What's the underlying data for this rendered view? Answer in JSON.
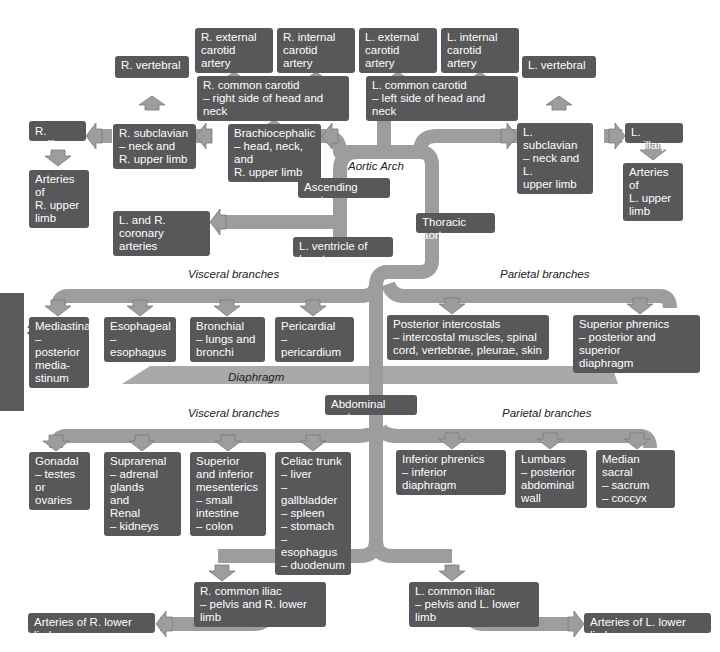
{
  "page_tab": "32",
  "colors": {
    "box": "#58585a",
    "arrow_fill": "#9d9d9f",
    "arrow_stroke": "#7a7a7c",
    "diaphragm": "#a9a9ab",
    "text": "#ffffff"
  },
  "labels": {
    "aortic_arch": "Aortic Arch",
    "diaphragm": "Diaphragm",
    "thoracic_visceral": "Visceral branches",
    "thoracic_parietal": "Parietal branches",
    "abdominal_visceral": "Visceral branches",
    "abdominal_parietal": "Parietal branches"
  },
  "nodes": {
    "r_ext_carotid": "R. external\ncarotid artery",
    "r_int_carotid": "R. internal\ncarotid artery",
    "l_ext_carotid": "L. external\ncarotid artery",
    "l_int_carotid": "L. internal\ncarotid artery",
    "r_vertebral": "R. vertebral",
    "r_common_carotid": "R. common carotid\n– right side of head and neck",
    "l_common_carotid": "L. common carotid\n– left side of head and neck",
    "l_vertebral": "L. vertebral",
    "r_axillary": "R. axillary",
    "r_subclavian": "R. subclavian\n– neck and\n   R. upper limb",
    "brachiocephalic": "Brachiocephalic\n– head, neck, and\n   R. upper limb",
    "l_subclavian": "L. subclavian\n– neck and L.\n   upper limb",
    "l_axillary": "L. axillary",
    "arteries_r_upper": "Arteries of\nR. upper\nlimb",
    "arteries_l_upper": "Arteries of\nL. upper\nlimb",
    "ascending_aorta": "Ascending aorta",
    "coronary": "L. and R. coronary\narteries",
    "l_ventricle": "L. ventricle of heart",
    "thoracic_aorta": "Thoracic aorta",
    "mediastinal": "Mediastinal\n– posterior\n   media-\n   stinum",
    "esophageal": "Esophageal\n– esophagus",
    "bronchial": "Bronchial\n– lungs and\n   bronchi",
    "pericardial": "Pericardial\n– pericardium",
    "post_intercostals": "Posterior intercostals\n– intercostal muscles, spinal\n   cord, vertebrae, pleurae, skin",
    "sup_phrenics": "Superior phrenics\n– posterior and superior\n   diaphragm",
    "abdominal_aorta": "Abdominal aorta",
    "gonadal": "Gonadal\n– testes or\n   ovaries",
    "suprarenal": "Suprarenal\n– adrenal\n   glands\n   and\nRenal\n– kidneys",
    "mesenterics": "Superior\nand inferior\nmesenterics\n– small\n   intestine\n– colon",
    "celiac": "Celiac trunk\n– liver\n– gallbladder\n– spleen\n– stomach\n– esophagus\n– duodenum",
    "inf_phrenics": "Inferior phrenics\n– inferior diaphragm",
    "lumbars": "Lumbars\n– posterior\n   abdominal\n   wall",
    "median_sacral": "Median sacral\n– sacrum\n– coccyx",
    "r_common_iliac": "R. common iliac\n– pelvis and R. lower limb",
    "l_common_iliac": "L. common iliac\n– pelvis and L. lower limb",
    "arteries_r_lower": "Arteries of R. lower limb",
    "arteries_l_lower": "Arteries of L. lower limb"
  }
}
